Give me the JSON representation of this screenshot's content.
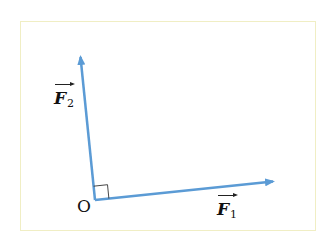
{
  "diagram": {
    "type": "vector-diagram",
    "origin": {
      "label": "O",
      "x": 95,
      "y": 200
    },
    "vectors": [
      {
        "id": "F1",
        "name": "F",
        "subscript": "1",
        "from": [
          95,
          200
        ],
        "to": [
          275,
          181
        ]
      },
      {
        "id": "F2",
        "name": "F",
        "subscript": "2",
        "from": [
          95,
          200
        ],
        "to": [
          80,
          54
        ]
      }
    ],
    "right_angle_marker": true,
    "colors": {
      "vector": "#5b9bd5",
      "frame_border": "#f0eec4",
      "text": "#111111"
    }
  }
}
